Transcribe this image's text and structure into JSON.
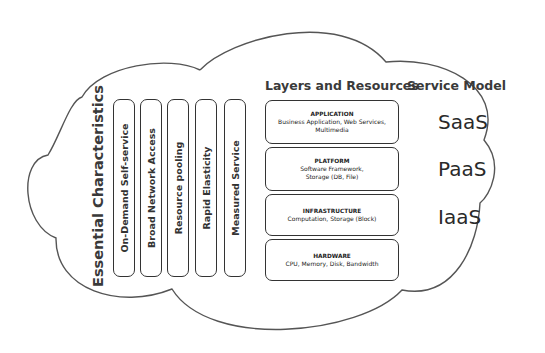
{
  "headers": {
    "characteristics": "Essential Characteristics",
    "layers": "Layers and Resources",
    "service_model": "Service Model"
  },
  "characteristics": [
    "On-Demand Self-service",
    "Broad Network Access",
    "Resource pooling",
    "Rapid Elasticity",
    "Measured Service"
  ],
  "layers": [
    {
      "name": "APPLICATION",
      "detail": "Business Application, Web Services, Multimedia"
    },
    {
      "name": "PLATFORM",
      "detail": "Software Framework, Storage (DB, File)"
    },
    {
      "name": "INFRASTRUCTURE",
      "detail": "Computation, Storage (Block)"
    },
    {
      "name": "HARDWARE",
      "detail": "CPU, Memory, Disk, Bandwidth"
    }
  ],
  "service_models": [
    "SaaS",
    "PaaS",
    "IaaS"
  ],
  "colors": {
    "outline": "#333333",
    "background": "#ffffff"
  }
}
